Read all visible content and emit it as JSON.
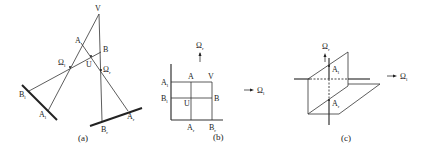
{
  "panels": {
    "a": {
      "caption": "(a)",
      "labels": {
        "V": "V",
        "A": "A",
        "B": "B",
        "U": "U",
        "Omega_l": "Ω",
        "Omega_l_sub": "l",
        "Omega_r": "Ω",
        "Omega_r_sub": "r",
        "B_l": "B",
        "B_l_sub": "l",
        "A_l": "A",
        "A_l_sub": "l",
        "A_r": "A",
        "A_r_sub": "r",
        "B_r": "B",
        "B_r_sub": "r"
      }
    },
    "b": {
      "caption": "(b)",
      "labels": {
        "A_l": "A",
        "A_l_sub": "l",
        "B_l": "B",
        "B_l_sub": "l",
        "A": "A",
        "V": "V",
        "U": "U",
        "B": "B",
        "A_r": "A",
        "A_r_sub": "r",
        "B_r": "B",
        "B_r_sub": "r",
        "Omega_r": "Ω",
        "Omega_r_sub": "r",
        "Omega_l": "Ω",
        "Omega_l_sub": "l"
      }
    },
    "c": {
      "caption": "(c)",
      "labels": {
        "Omega_r": "Ω",
        "Omega_r_sub": "r",
        "A_l": "A",
        "A_l_sub": "l",
        "A_r": "A",
        "A_r_sub": "r",
        "Omega_l": "Ω",
        "Omega_l_sub": "l"
      }
    }
  }
}
